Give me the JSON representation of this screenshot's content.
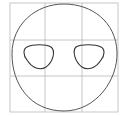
{
  "figure": {
    "grid": {
      "x": [
        10,
        45,
        82,
        118
      ],
      "y": [
        3,
        40,
        76,
        112
      ],
      "color": "#b8b8b8"
    },
    "outline_color": "#555555",
    "fill": "#ffffff"
  }
}
